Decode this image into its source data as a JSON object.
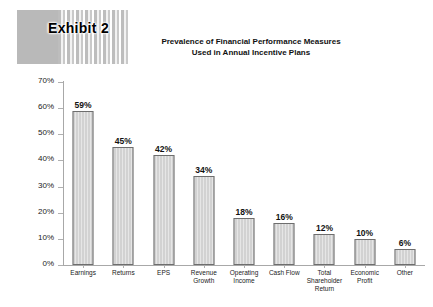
{
  "header": {
    "exhibit_label": "Exhibit 2",
    "band_solid_color": "#b9b9b9",
    "band_stripe_color": "#ffffff"
  },
  "chart_data": {
    "type": "bar",
    "title_line1": "Prevalence of Financial Performance Measures",
    "title_line2": "Used in Annual Incentive Plans",
    "xlabel": "",
    "ylabel": "",
    "ylim": [
      0,
      70
    ],
    "ytick_step": 10,
    "grid": false,
    "legend": null,
    "bar_fill_color": "#d2d2d2",
    "bar_border_color": "#6e6e6e",
    "categories": [
      "Earnings",
      "Returns",
      "EPS",
      "Revenue\nGrowth",
      "Operating\nIncome",
      "Cash Flow",
      "Total\nShareholder\nReturn",
      "Economic\nProfit",
      "Other"
    ],
    "values": [
      59,
      45,
      42,
      34,
      18,
      16,
      12,
      10,
      6
    ],
    "value_labels": [
      "59%",
      "45%",
      "42%",
      "34%",
      "18%",
      "16%",
      "12%",
      "10%",
      "6%"
    ],
    "ytick_labels": [
      "70%",
      "60%",
      "50%",
      "40%",
      "30%",
      "20%",
      "10%",
      "0%"
    ],
    "ytick_values": [
      70,
      60,
      50,
      40,
      30,
      20,
      10,
      0
    ]
  }
}
